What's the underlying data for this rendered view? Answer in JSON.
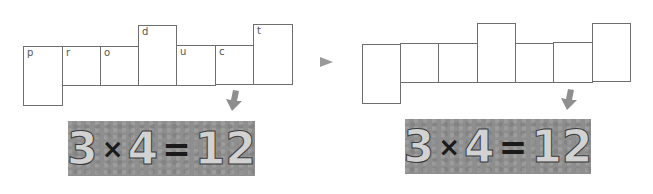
{
  "left_net": {
    "cells": [
      {
        "label": "p",
        "x": 23,
        "y": 46,
        "w": 40,
        "h": 60
      },
      {
        "label": "r",
        "x": 62,
        "y": 46,
        "w": 39,
        "h": 40
      },
      {
        "label": "o",
        "x": 100,
        "y": 46,
        "w": 39,
        "h": 40
      },
      {
        "label": "d",
        "x": 138,
        "y": 25,
        "w": 39,
        "h": 61
      },
      {
        "label": "u",
        "x": 176,
        "y": 45,
        "w": 40,
        "h": 41
      },
      {
        "label": "c",
        "x": 215,
        "y": 45,
        "w": 39,
        "h": 40
      },
      {
        "label": "t",
        "x": 253,
        "y": 24,
        "w": 40,
        "h": 61
      }
    ]
  },
  "right_net": {
    "cells": [
      {
        "label": "",
        "x": 362,
        "y": 44,
        "w": 39,
        "h": 60
      },
      {
        "label": "",
        "x": 400,
        "y": 43,
        "w": 39,
        "h": 40
      },
      {
        "label": "",
        "x": 438,
        "y": 43,
        "w": 40,
        "h": 40
      },
      {
        "label": "",
        "x": 477,
        "y": 23,
        "w": 39,
        "h": 60
      },
      {
        "label": "",
        "x": 515,
        "y": 43,
        "w": 39,
        "h": 40
      },
      {
        "label": "",
        "x": 553,
        "y": 42,
        "w": 40,
        "h": 41
      },
      {
        "label": "",
        "x": 592,
        "y": 23,
        "w": 39,
        "h": 59
      }
    ]
  },
  "left_equation": {
    "a": "3",
    "op": "×",
    "b": "4",
    "eq": "=",
    "result": "12"
  },
  "right_equation": {
    "a": "3",
    "op": "×",
    "b": "4",
    "eq": "=",
    "result": "12"
  },
  "colors": {
    "slate": "#8e8e8e",
    "arrow": "#9a9a9a",
    "border": "#6e6e6e"
  }
}
